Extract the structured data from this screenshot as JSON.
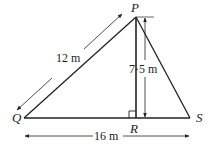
{
  "diagram": {
    "type": "triangle-with-altitude",
    "vertices": {
      "P": {
        "label": "P",
        "x": 136,
        "y": 17
      },
      "Q": {
        "label": "Q",
        "x": 24,
        "y": 118
      },
      "R": {
        "label": "R",
        "x": 136,
        "y": 118
      },
      "S": {
        "label": "S",
        "x": 190,
        "y": 118
      }
    },
    "measurements": {
      "QP": "12 m",
      "PR": "7·5 m",
      "QS": "16 m"
    },
    "right_angle_at": "R",
    "colors": {
      "line": "#222222",
      "background": "#ffffff"
    }
  }
}
